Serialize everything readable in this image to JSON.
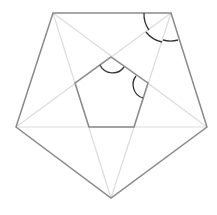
{
  "canvas": {
    "width": 217,
    "height": 215,
    "background": "#ffffff"
  },
  "colors": {
    "outer": "#8a8a8a",
    "diagonal": "#dcdcdc",
    "inner": "#8a8a8a",
    "arc": "#333333"
  },
  "outer_pentagon": {
    "points": "53,13 171,13 207,127 111,198 16,127"
  },
  "diagonals": [
    {
      "x1": 53,
      "y1": 13,
      "x2": 207,
      "y2": 127
    },
    {
      "x1": 53,
      "y1": 13,
      "x2": 111,
      "y2": 198
    },
    {
      "x1": 171,
      "y1": 13,
      "x2": 16,
      "y2": 127
    },
    {
      "x1": 171,
      "y1": 13,
      "x2": 111,
      "y2": 198
    },
    {
      "x1": 16,
      "y1": 127,
      "x2": 207,
      "y2": 127
    }
  ],
  "inner_pentagon": {
    "points": "111,57 148,83 134,127 89,127 75,83"
  },
  "arcs": [
    {
      "name": "outer-vertex-arc-1",
      "d": "M 144 13 A 27 27 0 0 0 149 30"
    },
    {
      "name": "outer-vertex-arc-2",
      "d": "M 146 32 A 27 27 0 0 0 162 42"
    },
    {
      "name": "outer-vertex-arc-3",
      "d": "M 163 40 A 28 28 0 0 0 178 40"
    },
    {
      "name": "inner-top-arc",
      "d": "M 100 65 A 14 14 0 0 0 124 67"
    },
    {
      "name": "inner-right-arc",
      "d": "M 136 76 A 14 14 0 0 0 143 98"
    }
  ]
}
